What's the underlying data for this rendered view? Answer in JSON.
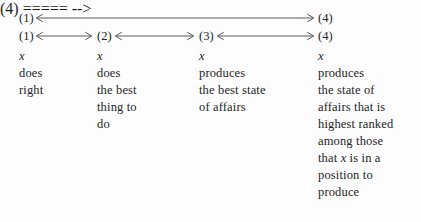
{
  "figure": {
    "nodes": {
      "n1": "(1)",
      "n2": "(2)",
      "n3": "(3)",
      "n4": "(4)"
    },
    "arrows": {
      "outer": {
        "from": "(1)",
        "to": "(4)",
        "style": "double-headed"
      },
      "inner": [
        {
          "from": "(1)",
          "to": "(2)",
          "style": "double-headed"
        },
        {
          "from": "(2)",
          "to": "(3)",
          "style": "double-headed"
        },
        {
          "from": "(3)",
          "to": "(4)",
          "style": "double-headed"
        }
      ]
    },
    "columns": [
      {
        "id": "column-1",
        "node": "(1)",
        "lines": [
          {
            "parts": [
              {
                "text": "x",
                "italic": true
              }
            ]
          },
          {
            "parts": [
              {
                "text": "does",
                "italic": false
              }
            ]
          },
          {
            "parts": [
              {
                "text": "right",
                "italic": false
              }
            ]
          }
        ]
      },
      {
        "id": "column-2",
        "node": "(2)",
        "lines": [
          {
            "parts": [
              {
                "text": "x",
                "italic": true
              }
            ]
          },
          {
            "parts": [
              {
                "text": "does",
                "italic": false
              }
            ]
          },
          {
            "parts": [
              {
                "text": "the best",
                "italic": false
              }
            ]
          },
          {
            "parts": [
              {
                "text": "thing to",
                "italic": false
              }
            ]
          },
          {
            "parts": [
              {
                "text": "do",
                "italic": false
              }
            ]
          }
        ]
      },
      {
        "id": "column-3",
        "node": "(3)",
        "lines": [
          {
            "parts": [
              {
                "text": "x",
                "italic": true
              }
            ]
          },
          {
            "parts": [
              {
                "text": "produces",
                "italic": false
              }
            ]
          },
          {
            "parts": [
              {
                "text": "the best state",
                "italic": false
              }
            ]
          },
          {
            "parts": [
              {
                "text": "of affairs",
                "italic": false
              }
            ]
          }
        ]
      },
      {
        "id": "column-4",
        "node": "(4)",
        "lines": [
          {
            "parts": [
              {
                "text": "x",
                "italic": true
              }
            ]
          },
          {
            "parts": [
              {
                "text": "produces",
                "italic": false
              }
            ]
          },
          {
            "parts": [
              {
                "text": "the state of",
                "italic": false
              }
            ]
          },
          {
            "parts": [
              {
                "text": "affairs that is",
                "italic": false
              }
            ]
          },
          {
            "parts": [
              {
                "text": "highest ranked",
                "italic": false
              }
            ]
          },
          {
            "parts": [
              {
                "text": "among those",
                "italic": false
              }
            ]
          },
          {
            "parts": [
              {
                "text": "that ",
                "italic": false
              },
              {
                "text": "x",
                "italic": true
              },
              {
                "text": " is in a",
                "italic": false
              }
            ]
          },
          {
            "parts": [
              {
                "text": "position to",
                "italic": false
              }
            ]
          },
          {
            "parts": [
              {
                "text": "produce",
                "italic": false
              }
            ]
          }
        ]
      }
    ],
    "colors": {
      "background": "#fdfdfd",
      "text": "#232325",
      "arrow": "#4a4a50"
    }
  }
}
